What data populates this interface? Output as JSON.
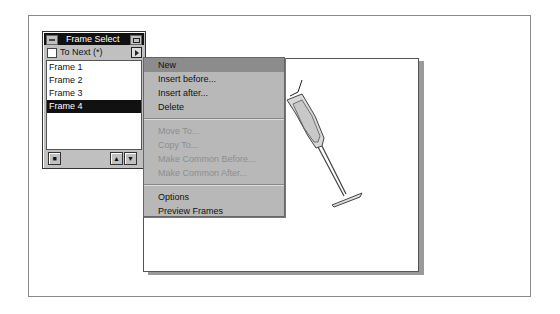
{
  "palette": {
    "title": "Frame Select",
    "to_next_label": "To Next (*)",
    "to_next_checked": false,
    "frames": [
      "Frame 1",
      "Frame 2",
      "Frame 3",
      "Frame 4"
    ],
    "selected_frame": "Frame 4",
    "buttons": {
      "new_frame_icon": "new-frame-icon",
      "up": "▲",
      "down": "▼"
    }
  },
  "menu": {
    "items": [
      {
        "label": "New",
        "state": "highlighted"
      },
      {
        "label": "Insert before...",
        "state": "enabled"
      },
      {
        "label": "Insert after...",
        "state": "enabled"
      },
      {
        "label": "Delete",
        "state": "enabled"
      },
      {
        "label": "Move To...",
        "state": "disabled"
      },
      {
        "label": "Copy To...",
        "state": "disabled"
      },
      {
        "label": "Make Common Before...",
        "state": "disabled"
      },
      {
        "label": "Make Common After...",
        "state": "disabled"
      },
      {
        "label": "Options",
        "state": "enabled"
      },
      {
        "label": "Preview Frames",
        "state": "enabled"
      }
    ]
  },
  "canvas": {
    "illustration": "champagne-glass"
  }
}
